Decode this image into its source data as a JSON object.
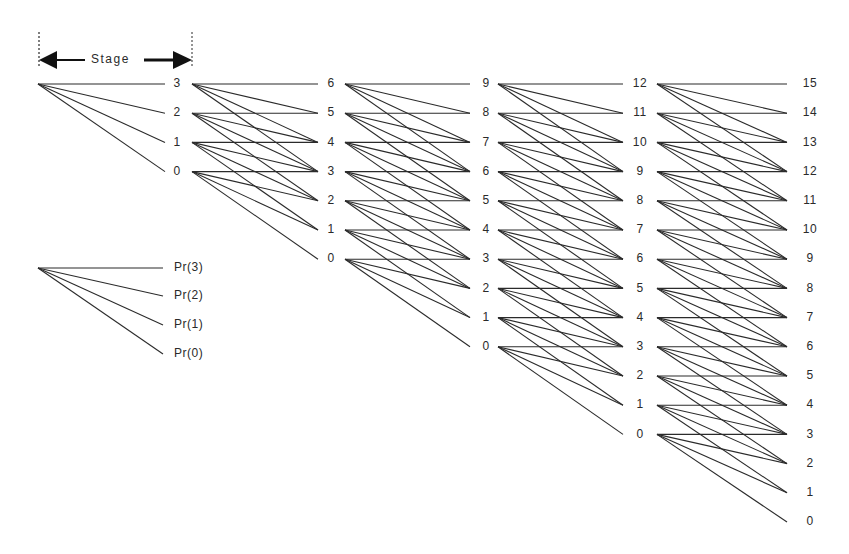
{
  "diagram": {
    "type": "lattice",
    "stage_marker": {
      "label": "Stage",
      "x_start": 38,
      "x_end": 192,
      "y": 60
    },
    "layout": {
      "origin_x": 38,
      "origin_y": 84,
      "row_spacing": 29.2,
      "stage_label_x": [
        177,
        331,
        486,
        640,
        810
      ],
      "stage_line_start_x": [
        38,
        192,
        345,
        498,
        657
      ],
      "stage_line_end_x": [
        165,
        318,
        470,
        623,
        787
      ]
    },
    "branching": [
      0,
      1,
      2,
      3
    ],
    "stages": [
      {
        "index": 1,
        "nodes": [
          3,
          2,
          1,
          0
        ]
      },
      {
        "index": 2,
        "nodes": [
          6,
          5,
          4,
          3,
          2,
          1,
          0
        ]
      },
      {
        "index": 3,
        "nodes": [
          9,
          8,
          7,
          6,
          5,
          4,
          3,
          2,
          1,
          0
        ]
      },
      {
        "index": 4,
        "nodes": [
          12,
          11,
          10,
          9,
          8,
          7,
          6,
          5,
          4,
          3,
          2,
          1,
          0
        ]
      },
      {
        "index": 5,
        "nodes": [
          15,
          14,
          13,
          12,
          11,
          10,
          9,
          8,
          7,
          6,
          5,
          4,
          3,
          2,
          1,
          0
        ]
      }
    ],
    "legend": {
      "origin": {
        "x": 38,
        "y": 268
      },
      "line_end_x": 163,
      "label_x": 174,
      "items": [
        {
          "label": "Pr(3)",
          "y": 268
        },
        {
          "label": "Pr(2)",
          "y": 296
        },
        {
          "label": "Pr(1)",
          "y": 325
        },
        {
          "label": "Pr(0)",
          "y": 354
        }
      ]
    }
  }
}
